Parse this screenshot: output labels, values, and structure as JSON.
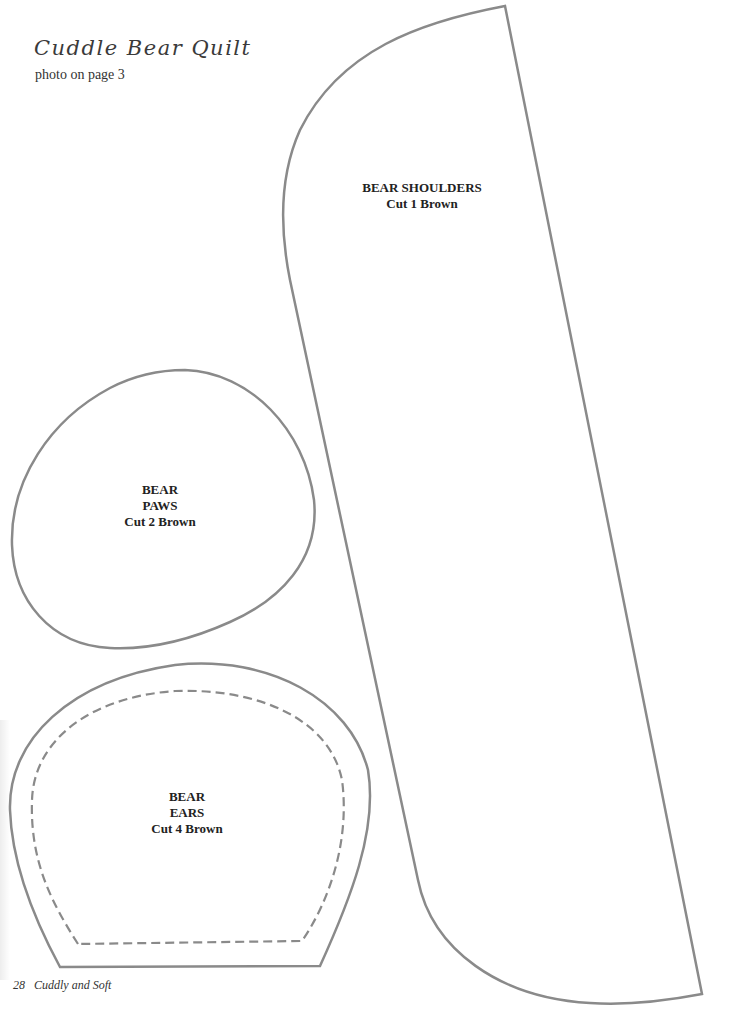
{
  "header": {
    "title": "Cuddle Bear Quilt",
    "subtitle": "photo on page 3"
  },
  "pieces": [
    {
      "id": "bear-shoulders",
      "lines": [
        "BEAR SHOULDERS",
        "Cut 1 Brown"
      ]
    },
    {
      "id": "bear-paws",
      "lines": [
        "BEAR",
        "PAWS",
        "Cut 2 Brown"
      ]
    },
    {
      "id": "bear-ears",
      "lines": [
        "BEAR",
        "EARS",
        "Cut 4 Brown"
      ]
    }
  ],
  "footer": {
    "page_number": "28",
    "book_title": "Cuddly and Soft"
  },
  "colors": {
    "outline": "#8a8a8a",
    "text": "#222222",
    "background": "#ffffff"
  }
}
